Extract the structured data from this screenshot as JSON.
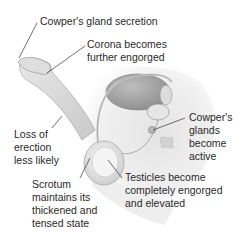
{
  "diagram": {
    "labels": {
      "cowper_secretion": "Cowper's gland secretion",
      "corona_1": "Corona becomes",
      "corona_2": "further engorged",
      "loss_1": "Loss of",
      "loss_2": "erection",
      "loss_3": "less likely",
      "glands_1": "Cowper's",
      "glands_2": "glands",
      "glands_3": "become",
      "glands_4": "active",
      "scrotum_1": "Scrotum",
      "scrotum_2": "maintains its",
      "scrotum_3": "thickened and",
      "scrotum_4": "tensed state",
      "testicles_1": "Testicles become",
      "testicles_2": "completely engorged",
      "testicles_3": "and elevated"
    }
  }
}
